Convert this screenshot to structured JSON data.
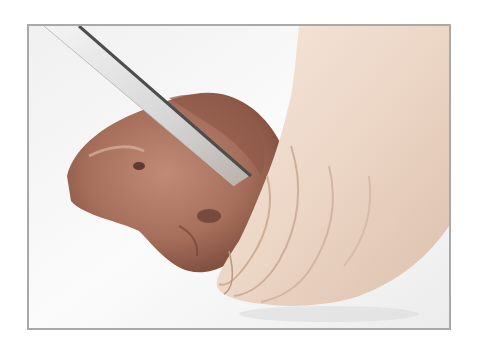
{
  "figure": {
    "frame_border_color": "#a9a9a9",
    "background_color": "#ffffff",
    "colors": {
      "surface": "#f5f5f5",
      "meat": "#a9735f",
      "meat_dark": "#7c4c3f",
      "meat_light": "#c69684",
      "skin": "#efdccd",
      "skin_shadow": "#d7bba8",
      "blade": "#d9d9d9",
      "blade_edge": "#555555"
    }
  }
}
